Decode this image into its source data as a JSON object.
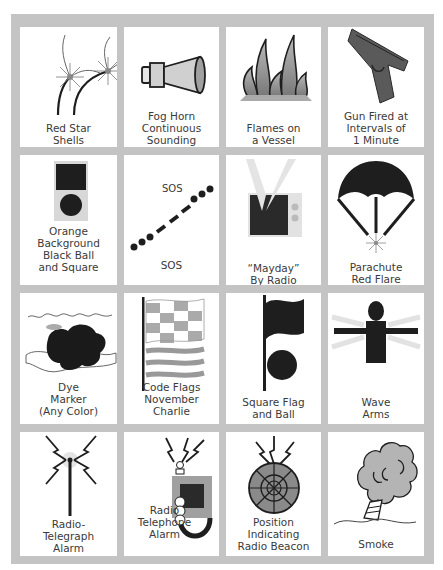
{
  "colors": {
    "frame": "#c4c4c4",
    "cell_bg": "#ffffff",
    "ink": "#1e1e1e",
    "gray_fill": "#9a9a9a",
    "light_gray": "#d8d8d8",
    "text": "#3a3a3a"
  },
  "signals": [
    {
      "id": "red-star-shells",
      "icon": "red-star-shells-icon",
      "label": "Red Star\nShells"
    },
    {
      "id": "fog-horn",
      "icon": "fog-horn-icon",
      "label": "Fog Horn\nContinuous\nSounding"
    },
    {
      "id": "flames",
      "icon": "flames-icon",
      "label": "Flames on\na Vessel"
    },
    {
      "id": "gun-fired",
      "icon": "gun-icon",
      "label": "Gun Fired at\nIntervals of\n1 Minute"
    },
    {
      "id": "orange-background",
      "icon": "orange-flag-icon",
      "label": "Orange\nBackground\nBlack Ball\nand Square"
    },
    {
      "id": "sos",
      "icon": "sos-morse-icon",
      "label": "SOS",
      "icon_text": "SOS"
    },
    {
      "id": "mayday",
      "icon": "radio-icon",
      "label": "“Mayday”\nBy Radio"
    },
    {
      "id": "parachute-flare",
      "icon": "parachute-icon",
      "label": "Parachute\nRed Flare"
    },
    {
      "id": "dye-marker",
      "icon": "dye-marker-icon",
      "label": "Dye\nMarker\n(Any Color)"
    },
    {
      "id": "code-flags",
      "icon": "code-flags-icon",
      "label": "Code Flags\nNovember\nCharlie"
    },
    {
      "id": "square-flag-ball",
      "icon": "square-flag-ball-icon",
      "label": "Square Flag\nand Ball"
    },
    {
      "id": "wave-arms",
      "icon": "wave-arms-icon",
      "label": "Wave\nArms"
    },
    {
      "id": "radio-telegraph",
      "icon": "radio-telegraph-icon",
      "label": "Radio-\nTelegraph\nAlarm"
    },
    {
      "id": "radio-telephone",
      "icon": "radio-telephone-icon",
      "label": "Radio\nTelephone\nAlarm"
    },
    {
      "id": "epirb",
      "icon": "radio-beacon-icon",
      "label": "Position\nIndicating\nRadio Beacon"
    },
    {
      "id": "smoke",
      "icon": "smoke-icon",
      "label": "Smoke"
    }
  ]
}
